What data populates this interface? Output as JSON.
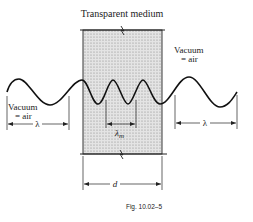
{
  "figure": {
    "title": "Transparent medium",
    "caption": "Fig. 10.02–5",
    "left_region": {
      "line1": "Vacuum",
      "line2": "= air",
      "wavelength_label": "λ"
    },
    "right_region": {
      "line1": "Vacuum",
      "line2": "= air",
      "wavelength_label": "λ"
    },
    "medium": {
      "wavelength_label": "λ",
      "wavelength_subscript": "m",
      "thickness_label": "d"
    },
    "colors": {
      "line": "#222222",
      "medium_fill": "#d9d9d9",
      "background": "#ffffff"
    }
  }
}
